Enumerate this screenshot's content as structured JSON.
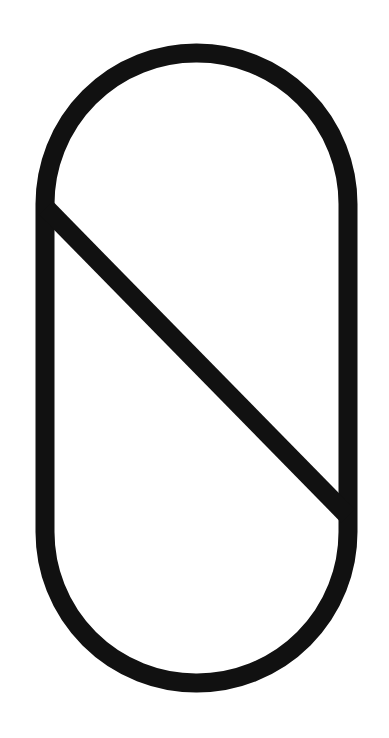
{
  "figure": {
    "title": "Stadium outline with diagonal chord",
    "background_color": "#ffffff",
    "stroke_color": "#111111",
    "stroke_width": 19,
    "canvas": {
      "width": 389,
      "height": 738
    },
    "shapes": [
      {
        "name": "stadium-outline",
        "type": "rounded-rectangle",
        "x": 45,
        "y": 53,
        "width": 303,
        "height": 630,
        "corner_radius": 151
      },
      {
        "name": "diagonal-chord",
        "type": "line",
        "x1": 46,
        "y1": 208,
        "x2": 348,
        "y2": 516
      }
    ],
    "geometry_labels": {
      "outline_label": "stadium outline",
      "diagonal_label": "diagonal chord",
      "top_cap_label": "top semicircular cap",
      "bottom_cap_label": "bottom semicircular cap",
      "left_edge_label": "left vertical edge",
      "right_edge_label": "right vertical edge"
    }
  }
}
